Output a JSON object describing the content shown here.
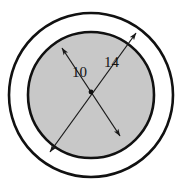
{
  "figure": {
    "background_color": "#ffffff",
    "width": 187,
    "height": 190
  },
  "chart_data": {
    "type": "diagram",
    "title": "",
    "subtitle": "",
    "xlabel": "",
    "ylabel": "",
    "shapes": [
      {
        "name": "outer-circle",
        "kind": "circle",
        "center_x": 91,
        "center_y": 95,
        "radius": 82,
        "fill": "#ffffff",
        "stroke": "#111111",
        "stroke_width": 2.6
      },
      {
        "name": "inner-circle",
        "kind": "circle",
        "center_x": 91,
        "center_y": 95,
        "radius": 63,
        "fill": "#c8c8c8",
        "stroke": "#111111",
        "stroke_width": 2.6
      }
    ],
    "dimensions": [
      {
        "name": "inner-diameter",
        "value": 10,
        "label": "10",
        "applies_to": "inner-circle",
        "x1": 62,
        "y1": 48,
        "x2": 120,
        "y2": 136,
        "label_x": 72,
        "label_y": 77,
        "arrow_both_ends": true,
        "stroke": "#1a1a1a"
      },
      {
        "name": "outer-diameter",
        "value": 14,
        "label": "14",
        "applies_to": "outer-circle",
        "x1": 136,
        "y1": 33,
        "x2": 50,
        "y2": 152,
        "label_x": 104,
        "label_y": 67,
        "arrow_both_ends": true,
        "stroke": "#1a1a1a"
      }
    ],
    "center_marker": {
      "name": "center-point",
      "x": 91,
      "y": 92,
      "radius": 2.4,
      "fill": "#111111"
    },
    "colors": {
      "annulus_fill": "#ffffff",
      "disc_fill": "#c8c8c8",
      "outline": "#111111",
      "dimension_line": "#1a1a1a",
      "text": "#141414"
    },
    "grid": false,
    "legend": null
  }
}
